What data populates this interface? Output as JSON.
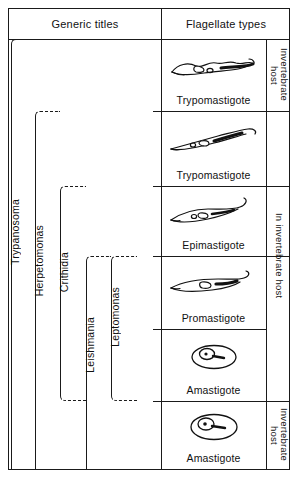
{
  "header": {
    "generic_titles": "Generic titles",
    "flagellate_types": "Flagellate types"
  },
  "rows": [
    {
      "flagellate": "Trypomastigote",
      "art": "trypomastigote-wavy"
    },
    {
      "flagellate": "Trypomastigote",
      "art": "trypomastigote-slim"
    },
    {
      "flagellate": "Epimastigote",
      "art": "epimastigote"
    },
    {
      "flagellate": "Promastigote",
      "art": "promastigote"
    },
    {
      "flagellate": "Amastigote",
      "art": "amastigote"
    },
    {
      "flagellate": "Amastigote",
      "art": "amastigote"
    }
  ],
  "host_groups": [
    {
      "label": "Invertebrate\nhost",
      "rows": 1
    },
    {
      "label": "In invertebrate host",
      "rows": 4
    },
    {
      "label": "Invertebrate\nhost",
      "rows": 1
    }
  ],
  "genera": [
    {
      "name": "Trypanosoma",
      "top_row": 1,
      "bottom_row": 6
    },
    {
      "name": "Herpetomonas",
      "top_row": 2,
      "bottom_row": 6
    },
    {
      "name": "Crithidia",
      "top_row": 3,
      "bottom_row": 5
    },
    {
      "name": "Leishmania",
      "top_row": 4,
      "bottom_row": 6
    },
    {
      "name": "Leptomonas",
      "top_row": 4,
      "bottom_row": 5
    }
  ],
  "colors": {
    "ink": "#1a1a1a",
    "paper": "#ffffff"
  }
}
